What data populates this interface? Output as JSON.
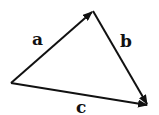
{
  "diagram": {
    "title": "",
    "type": "vector-triangle",
    "vertices": {
      "left": [
        11,
        83
      ],
      "top": [
        93,
        11
      ],
      "right": [
        148,
        105
      ]
    },
    "vectors": [
      {
        "name": "a",
        "from": "left",
        "to": "top",
        "label": "a",
        "label_pos": [
          36,
          44
        ]
      },
      {
        "name": "b",
        "from": "top",
        "to": "right",
        "label": "b",
        "label_pos": [
          121,
          46
        ]
      },
      {
        "name": "c",
        "from": "left",
        "to": "right",
        "label": "c",
        "label_pos": [
          77,
          112
        ]
      }
    ],
    "stroke_color": "#111111"
  }
}
